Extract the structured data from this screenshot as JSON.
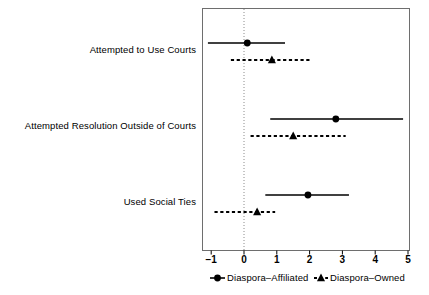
{
  "chart_data": {
    "type": "scatter",
    "subtype": "coefficient-forest-plot",
    "title": "",
    "subtitle": "",
    "xlabel": "",
    "ylabel": "",
    "xlim": [
      -1.3,
      5.3
    ],
    "xticks": [
      -1,
      0,
      1,
      2,
      3,
      4,
      5
    ],
    "xtick_labels": [
      "−1",
      "0",
      "1",
      "2",
      "3",
      "4",
      "5"
    ],
    "grid": false,
    "zero_reference_line": {
      "value": 0,
      "style": "dotted",
      "color": "#8c8c8c"
    },
    "frame": true,
    "legend_position": "bottom-center",
    "categories": [
      "Attempted to Use Courts",
      "Attempted Resolution Outside of Courts",
      "Used Social Ties"
    ],
    "series": [
      {
        "name": "Diaspora–Affiliated",
        "marker": "circle",
        "linestyle": "solid",
        "color": "#000000",
        "estimates": [
          0.1,
          2.8,
          1.95
        ],
        "ci_low": [
          -1.1,
          0.8,
          0.65
        ],
        "ci_high": [
          1.25,
          4.85,
          3.2
        ]
      },
      {
        "name": "Diaspora–Owned",
        "marker": "triangle",
        "linestyle": "dashed",
        "color": "#000000",
        "estimates": [
          0.85,
          1.5,
          0.4
        ],
        "ci_low": [
          -0.4,
          0.2,
          -0.9
        ],
        "ci_high": [
          2.0,
          3.1,
          0.95
        ]
      }
    ]
  },
  "legend": {
    "items": [
      {
        "label": "Diaspora–Affiliated",
        "marker": "circle",
        "linestyle": "solid"
      },
      {
        "label": "Diaspora–Owned",
        "marker": "triangle",
        "linestyle": "dashed"
      }
    ]
  },
  "axis": {
    "tick_labels": [
      "−1",
      "0",
      "1",
      "2",
      "3",
      "4",
      "5"
    ]
  },
  "category_labels": [
    "Attempted to Use Courts",
    "Attempted Resolution Outside of Courts",
    "Used Social Ties"
  ]
}
